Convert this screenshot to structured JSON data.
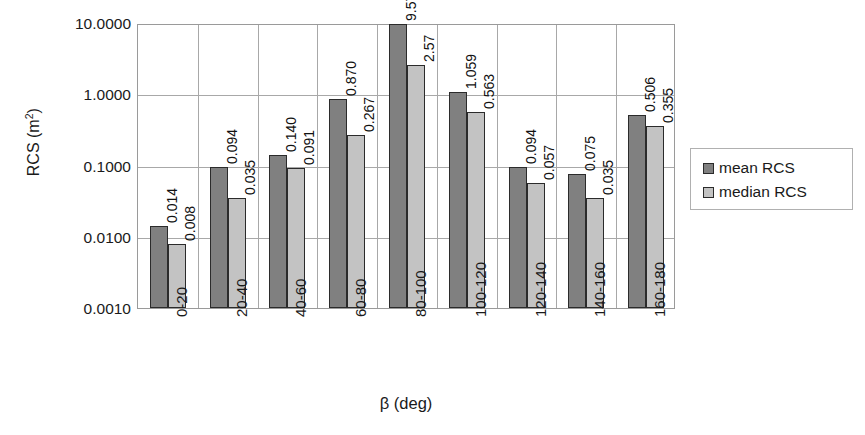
{
  "chart_data": {
    "type": "bar",
    "title": "",
    "xlabel": "β (deg)",
    "ylabel": "RCS (m²)",
    "yscale": "log",
    "ylim": [
      0.001,
      10.0
    ],
    "grid": "horizontal-and-group-separators",
    "legend_position": "right",
    "categories": [
      "0-20",
      "20-40",
      "40-60",
      "60-80",
      "80-100",
      "100-120",
      "120-140",
      "140-160",
      "160-180"
    ],
    "ytick_labels": [
      "10.0000",
      "1.0000",
      "0.1000",
      "0.0100",
      "0.0010"
    ],
    "ytick_values": [
      10.0,
      1.0,
      0.1,
      0.01,
      0.001
    ],
    "series": [
      {
        "name": "mean RCS",
        "color": "#808080",
        "values": [
          0.014,
          0.094,
          0.14,
          0.87,
          9.576,
          1.059,
          0.094,
          0.075,
          0.506
        ],
        "labels": [
          "0.014",
          "0.094",
          "0.140",
          "0.870",
          "9.576",
          "1.059",
          "0.094",
          "0.075",
          "0.506"
        ]
      },
      {
        "name": "median RCS",
        "color": "#c3c3c3",
        "values": [
          0.008,
          0.035,
          0.091,
          0.267,
          2.57,
          0.563,
          0.057,
          0.035,
          0.355
        ],
        "labels": [
          "0.008",
          "0.035",
          "0.091",
          "0.267",
          "2.57",
          "0.563",
          "0.057",
          "0.035",
          "0.355"
        ]
      }
    ]
  },
  "legend": {
    "entries": [
      {
        "label": "mean RCS",
        "swatch": "mean"
      },
      {
        "label": "median RCS",
        "swatch": "median"
      }
    ]
  },
  "axis": {
    "x_title": "β (deg)",
    "y_title_main": "RCS (m",
    "y_title_sup": "2",
    "y_title_close": ")"
  }
}
